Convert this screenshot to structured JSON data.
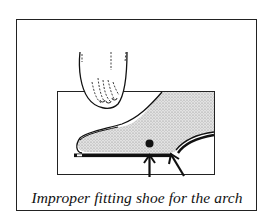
{
  "figure": {
    "caption": "Improper fitting shoe for the arch",
    "elements": {
      "toes_view": "foot toes front view",
      "shoe_side_view": "foot in shoe side view",
      "arch_point": "pressure point dot",
      "arrows": [
        "upward arrow at arch",
        "diagonal arrow at heel of arch"
      ]
    },
    "colors": {
      "ink": "#111111",
      "background": "#ffffff",
      "shading": "#c8c8c8"
    }
  }
}
